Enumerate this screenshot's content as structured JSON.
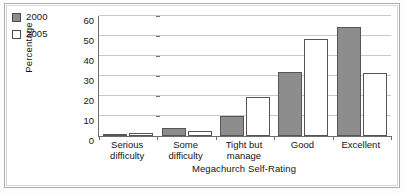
{
  "chart_data": {
    "type": "bar",
    "title": "",
    "subtitle": "",
    "xlabel": "Megachurch Self-Rating",
    "ylabel": "Percentage",
    "categories": [
      "Serious difficulty",
      "Some difficulty",
      "Tight but manage",
      "Good",
      "Excellent"
    ],
    "category_lines": [
      [
        "Serious",
        "difficulty"
      ],
      [
        "Some",
        "difficulty"
      ],
      [
        "Tight but",
        "manage"
      ],
      [
        "Good",
        ""
      ],
      [
        "Excellent",
        ""
      ]
    ],
    "series": [
      {
        "name": "2000",
        "color": "#8d8d8d",
        "values": [
          1,
          4,
          10,
          32,
          54.5
        ]
      },
      {
        "name": "2005",
        "color": "#ffffff",
        "values": [
          1.5,
          2.5,
          19.5,
          48.5,
          31.5
        ]
      }
    ],
    "ylim": [
      0,
      60
    ],
    "yticks": [
      0,
      10,
      20,
      30,
      40,
      50,
      60
    ],
    "ytick_labels": [
      "0",
      "10",
      "20",
      "30",
      "40",
      "50",
      "60"
    ],
    "grid": true,
    "grid_axis": "y",
    "legend_position": "top-left-outside"
  },
  "legend": {
    "items": [
      {
        "label": "2000",
        "swatch": "filled-gray-square"
      },
      {
        "label": "2005",
        "swatch": "empty-white-square"
      }
    ]
  },
  "colors": {
    "series_2000": "#8d8d8d",
    "series_2005": "#ffffff",
    "bar_outline": "#555555",
    "axis": "#6d6d6d",
    "gridline": "#c9c9c9",
    "frame": "#aeaeae",
    "text": "#141414",
    "background": "#ffffff"
  }
}
